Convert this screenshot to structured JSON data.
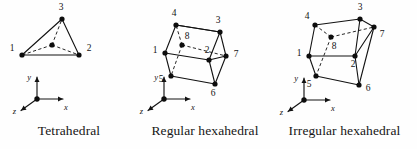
{
  "figure": {
    "background_color": "#fefefe",
    "ink_color": "#121212",
    "panels": [
      {
        "id": "tetrahedral",
        "caption": "Tetrahedral",
        "element_type": "tetrahedron",
        "node_count": 4,
        "nodes": [
          {
            "label": "1",
            "x": 22,
            "y": 55,
            "hidden": false,
            "label_dx": -10,
            "label_dy": -6
          },
          {
            "label": "2",
            "x": 79,
            "y": 55,
            "hidden": false,
            "label_dx": 10,
            "label_dy": -6
          },
          {
            "label": "3",
            "x": 62,
            "y": 19,
            "hidden": false,
            "label_dx": -1,
            "label_dy": -11
          },
          {
            "label": "",
            "x": 52,
            "y": 45,
            "hidden": true,
            "label_dx": 0,
            "label_dy": 0
          }
        ],
        "visible_edges": [
          [
            "1",
            "2"
          ],
          [
            "1",
            "3"
          ],
          [
            "2",
            "3"
          ]
        ],
        "hidden_edges": [
          [
            "4",
            "1"
          ],
          [
            "4",
            "2"
          ],
          [
            "4",
            "3"
          ]
        ],
        "axes": {
          "origin_x": 37,
          "origin_y": 99,
          "x_label": "x",
          "y_label": "y",
          "z_label": "z"
        }
      },
      {
        "id": "regular-hexahedral",
        "caption": "Regular hexahedral",
        "element_type": "hexahedron",
        "node_count": 8,
        "nodes": [
          {
            "label": "1",
            "x": 31,
            "y": 53,
            "hidden": false,
            "label_dx": -10,
            "label_dy": -2
          },
          {
            "label": "2",
            "x": 75,
            "y": 60,
            "hidden": false,
            "label_dx": -2,
            "label_dy": -9
          },
          {
            "label": "3",
            "x": 86,
            "y": 32,
            "hidden": false,
            "label_dx": -2,
            "label_dy": -11
          },
          {
            "label": "4",
            "x": 42,
            "y": 25,
            "hidden": false,
            "label_dx": -2,
            "label_dy": -11
          },
          {
            "label": "5",
            "x": 37,
            "y": 76,
            "hidden": false,
            "label_dx": -10,
            "label_dy": 4
          },
          {
            "label": "6",
            "x": 81,
            "y": 84,
            "hidden": false,
            "label_dx": -2,
            "label_dy": 10
          },
          {
            "label": "7",
            "x": 92,
            "y": 56,
            "hidden": false,
            "label_dx": 10,
            "label_dy": -1
          },
          {
            "label": "8",
            "x": 48,
            "y": 45,
            "hidden": true,
            "label_dx": 5,
            "label_dy": -8
          }
        ],
        "visible_edges": [
          [
            "1",
            "2"
          ],
          [
            "2",
            "3"
          ],
          [
            "3",
            "4"
          ],
          [
            "4",
            "1"
          ],
          [
            "5",
            "6"
          ],
          [
            "6",
            "7"
          ],
          [
            "7",
            "3"
          ],
          [
            "1",
            "5"
          ],
          [
            "2",
            "6"
          ],
          [
            "2",
            "7"
          ],
          [
            "4",
            "3"
          ]
        ],
        "hidden_edges": [
          [
            "8",
            "4"
          ],
          [
            "8",
            "5"
          ],
          [
            "8",
            "7"
          ]
        ],
        "axes": {
          "origin_x": 30,
          "origin_y": 99,
          "x_label": "x",
          "y_label": "y",
          "z_label": "z"
        }
      },
      {
        "id": "irregular-hexahedral",
        "caption": "Irregular hexahedral",
        "element_type": "hexahedron",
        "node_count": 8,
        "nodes": [
          {
            "label": "1",
            "x": 37,
            "y": 56,
            "hidden": false,
            "label_dx": -10,
            "label_dy": -2
          },
          {
            "label": "2",
            "x": 83,
            "y": 56,
            "hidden": false,
            "label_dx": -2,
            "label_dy": 9
          },
          {
            "label": "3",
            "x": 88,
            "y": 19,
            "hidden": false,
            "label_dx": 0,
            "label_dy": -11
          },
          {
            "label": "4",
            "x": 43,
            "y": 25,
            "hidden": false,
            "label_dx": -8,
            "label_dy": -8
          },
          {
            "label": "5",
            "x": 44,
            "y": 76,
            "hidden": false,
            "label_dx": -7,
            "label_dy": 9
          },
          {
            "label": "6",
            "x": 87,
            "y": 85,
            "hidden": false,
            "label_dx": 9,
            "label_dy": 4
          },
          {
            "label": "7",
            "x": 102,
            "y": 27,
            "hidden": false,
            "label_dx": 8,
            "label_dy": 8
          },
          {
            "label": "8",
            "x": 59,
            "y": 37,
            "hidden": true,
            "label_dx": 3,
            "label_dy": 10
          }
        ],
        "visible_edges": [
          [
            "1",
            "2"
          ],
          [
            "2",
            "3"
          ],
          [
            "3",
            "4"
          ],
          [
            "4",
            "1"
          ],
          [
            "5",
            "6"
          ],
          [
            "6",
            "7"
          ],
          [
            "7",
            "3"
          ],
          [
            "1",
            "5"
          ],
          [
            "2",
            "6"
          ],
          [
            "2",
            "7"
          ]
        ],
        "hidden_edges": [
          [
            "8",
            "4"
          ],
          [
            "8",
            "5"
          ],
          [
            "8",
            "7"
          ]
        ],
        "axes": {
          "origin_x": 32,
          "origin_y": 100,
          "x_label": "x",
          "y_label": "y",
          "z_label": "z"
        }
      }
    ]
  }
}
